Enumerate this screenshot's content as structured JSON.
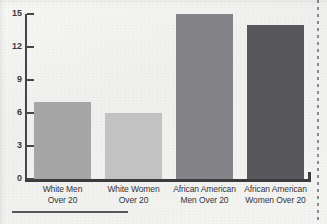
{
  "chart_data": {
    "type": "bar",
    "title": "",
    "xlabel": "",
    "ylabel": "",
    "categories": [
      "White Men Over 20",
      "White Women Over 20",
      "African American Men Over 20",
      "African American Women Over 20"
    ],
    "category_lines": [
      [
        "White Men",
        "Over 20"
      ],
      [
        "White Women",
        "Over 20"
      ],
      [
        "African American",
        "Men Over 20"
      ],
      [
        "African American",
        "Women Over 20"
      ]
    ],
    "values": [
      7,
      6,
      15,
      14
    ],
    "ylim": [
      0,
      15
    ],
    "yticks": [
      0,
      3,
      6,
      9,
      12,
      15
    ],
    "ytick_labels": [
      "0",
      "3",
      "6",
      "9",
      "12",
      "15"
    ],
    "grid": false,
    "legend": "none",
    "bar_colors": [
      "#a6a6a6",
      "#c2c2c2",
      "#848488",
      "#58585c"
    ]
  },
  "artifacts": {
    "perforation_label": "page-edge-perforation",
    "bottom_rule_label": "footnote-rule"
  }
}
